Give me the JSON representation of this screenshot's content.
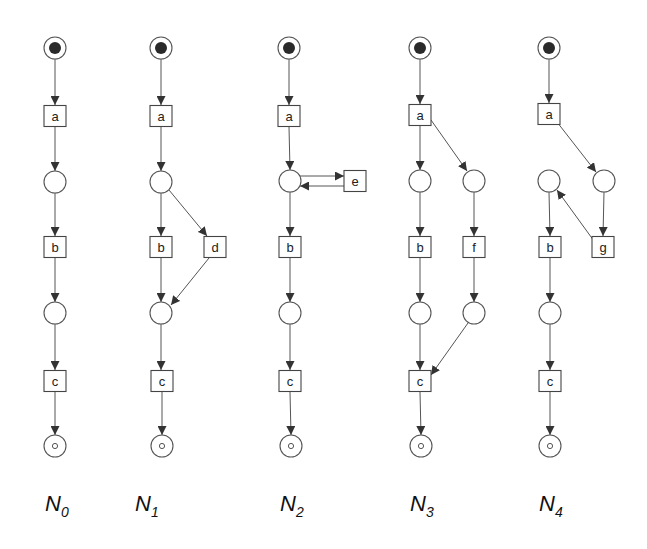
{
  "diagram": {
    "type": "petri-net-comparison",
    "place_radius": 11,
    "transition_size": [
      22,
      21
    ],
    "colors": {
      "stroke": "#555555",
      "token": "#2a2a2a",
      "background": "#ffffff"
    },
    "nets": [
      {
        "id": "N0",
        "label_main": "N",
        "label_sub": "0",
        "label_pos": [
          45,
          511
        ],
        "places": [
          {
            "id": "p_start",
            "x": 55,
            "y": 48,
            "kind": "initial"
          },
          {
            "id": "p1",
            "x": 55,
            "y": 182,
            "kind": "normal"
          },
          {
            "id": "p2",
            "x": 55,
            "y": 313,
            "kind": "normal"
          },
          {
            "id": "p_end",
            "x": 55,
            "y": 446,
            "kind": "final"
          }
        ],
        "transitions": [
          {
            "id": "a",
            "label": "a",
            "x": 55,
            "y": 116
          },
          {
            "id": "b",
            "label": "b",
            "x": 55,
            "y": 247
          },
          {
            "id": "c",
            "label": "c",
            "x": 55,
            "y": 381
          }
        ],
        "arcs": [
          [
            55,
            59,
            55,
            105
          ],
          [
            55,
            127,
            55,
            171
          ],
          [
            55,
            193,
            55,
            236
          ],
          [
            55,
            258,
            55,
            302
          ],
          [
            55,
            324,
            55,
            370
          ],
          [
            55,
            392,
            55,
            435
          ]
        ]
      },
      {
        "id": "N1",
        "label_main": "N",
        "label_sub": "1",
        "label_pos": [
          135,
          511
        ],
        "places": [
          {
            "id": "p_start",
            "x": 161,
            "y": 48,
            "kind": "initial"
          },
          {
            "id": "p1",
            "x": 161,
            "y": 182,
            "kind": "normal"
          },
          {
            "id": "p2",
            "x": 161,
            "y": 313,
            "kind": "normal"
          },
          {
            "id": "p_end",
            "x": 162,
            "y": 446,
            "kind": "final"
          }
        ],
        "transitions": [
          {
            "id": "a",
            "label": "a",
            "x": 161,
            "y": 116
          },
          {
            "id": "b",
            "label": "b",
            "x": 161,
            "y": 247
          },
          {
            "id": "d",
            "label": "d",
            "x": 215,
            "y": 247
          },
          {
            "id": "c",
            "label": "c",
            "x": 162,
            "y": 381
          }
        ],
        "arcs": [
          [
            161,
            59,
            161,
            105
          ],
          [
            161,
            127,
            161,
            171
          ],
          [
            161,
            193,
            161,
            236
          ],
          [
            169,
            190,
            207,
            236
          ],
          [
            161,
            258,
            161,
            302
          ],
          [
            209,
            258,
            171,
            305
          ],
          [
            161,
            324,
            161,
            370
          ],
          [
            162,
            392,
            162,
            435
          ]
        ]
      },
      {
        "id": "N2",
        "label_main": "N",
        "label_sub": "2",
        "label_pos": [
          280,
          511
        ],
        "places": [
          {
            "id": "p_start",
            "x": 289,
            "y": 48,
            "kind": "initial"
          },
          {
            "id": "p1",
            "x": 290,
            "y": 181,
            "kind": "normal"
          },
          {
            "id": "p2",
            "x": 290,
            "y": 313,
            "kind": "normal"
          },
          {
            "id": "p_end",
            "x": 291,
            "y": 446,
            "kind": "final"
          }
        ],
        "transitions": [
          {
            "id": "a",
            "label": "a",
            "x": 289,
            "y": 116
          },
          {
            "id": "e",
            "label": "e",
            "x": 355,
            "y": 181
          },
          {
            "id": "b",
            "label": "b",
            "x": 290,
            "y": 247
          },
          {
            "id": "c",
            "label": "c",
            "x": 290,
            "y": 381
          }
        ],
        "arcs": [
          [
            289,
            59,
            289,
            105
          ],
          [
            289,
            127,
            290,
            170
          ],
          [
            300,
            176,
            344,
            176
          ],
          [
            344,
            186,
            300,
            186
          ],
          [
            290,
            192,
            290,
            236
          ],
          [
            290,
            258,
            290,
            302
          ],
          [
            290,
            324,
            290,
            370
          ],
          [
            290,
            392,
            291,
            435
          ]
        ]
      },
      {
        "id": "N3",
        "label_main": "N",
        "label_sub": "3",
        "label_pos": [
          410,
          511
        ],
        "places": [
          {
            "id": "p_start",
            "x": 420,
            "y": 48,
            "kind": "initial"
          },
          {
            "id": "p1",
            "x": 420,
            "y": 181,
            "kind": "normal"
          },
          {
            "id": "p2",
            "x": 474,
            "y": 181,
            "kind": "normal"
          },
          {
            "id": "p3",
            "x": 420,
            "y": 313,
            "kind": "normal"
          },
          {
            "id": "p4",
            "x": 474,
            "y": 313,
            "kind": "normal"
          },
          {
            "id": "p_end",
            "x": 421,
            "y": 446,
            "kind": "final"
          }
        ],
        "transitions": [
          {
            "id": "a",
            "label": "a",
            "x": 420,
            "y": 115
          },
          {
            "id": "b",
            "label": "b",
            "x": 420,
            "y": 247
          },
          {
            "id": "f",
            "label": "f",
            "x": 474,
            "y": 247
          },
          {
            "id": "c",
            "label": "c",
            "x": 420,
            "y": 381
          }
        ],
        "arcs": [
          [
            420,
            59,
            420,
            104
          ],
          [
            420,
            126,
            420,
            170
          ],
          [
            431,
            120,
            467,
            171
          ],
          [
            420,
            192,
            420,
            236
          ],
          [
            474,
            192,
            474,
            236
          ],
          [
            420,
            258,
            420,
            302
          ],
          [
            474,
            258,
            474,
            302
          ],
          [
            420,
            324,
            420,
            370
          ],
          [
            468,
            323,
            431,
            375
          ],
          [
            420,
            392,
            421,
            435
          ]
        ]
      },
      {
        "id": "N4",
        "label_main": "N",
        "label_sub": "4",
        "label_pos": [
          539,
          511
        ],
        "places": [
          {
            "id": "p_start",
            "x": 549,
            "y": 48,
            "kind": "initial"
          },
          {
            "id": "p1",
            "x": 549,
            "y": 181,
            "kind": "normal"
          },
          {
            "id": "p2",
            "x": 604,
            "y": 181,
            "kind": "normal"
          },
          {
            "id": "p3",
            "x": 550,
            "y": 313,
            "kind": "normal"
          },
          {
            "id": "p_end",
            "x": 550,
            "y": 446,
            "kind": "final"
          }
        ],
        "transitions": [
          {
            "id": "a",
            "label": "a",
            "x": 549,
            "y": 114
          },
          {
            "id": "b",
            "label": "b",
            "x": 550,
            "y": 247
          },
          {
            "id": "g",
            "label": "g",
            "x": 603,
            "y": 247
          },
          {
            "id": "c",
            "label": "c",
            "x": 550,
            "y": 381
          }
        ],
        "arcs": [
          [
            549,
            59,
            549,
            103
          ],
          [
            557,
            122,
            596,
            172
          ],
          [
            604,
            192,
            603,
            236
          ],
          [
            549,
            192,
            550,
            236
          ],
          [
            594,
            241,
            557,
            190
          ],
          [
            550,
            258,
            550,
            302
          ],
          [
            550,
            324,
            550,
            370
          ],
          [
            550,
            392,
            550,
            435
          ]
        ]
      }
    ]
  }
}
